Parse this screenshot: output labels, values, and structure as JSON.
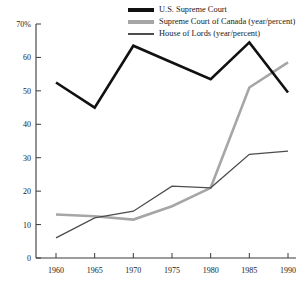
{
  "chart_data": {
    "type": "line",
    "title": "",
    "subtitle": "",
    "xlabel": "",
    "ylabel": "",
    "x": [
      1960,
      1965,
      1970,
      1975,
      1980,
      1985,
      1990
    ],
    "categories": [
      "1960",
      "1965",
      "1970",
      "1975",
      "1980",
      "1985",
      "1990"
    ],
    "xlim": [
      1960,
      1990
    ],
    "ylim": [
      0,
      70
    ],
    "y_ticks": [
      0,
      10,
      20,
      30,
      40,
      50,
      60,
      70
    ],
    "y_tick_labels": [
      "0",
      "10",
      "20",
      "30",
      "40",
      "50",
      "60",
      "70%"
    ],
    "grid": false,
    "legend_position": "top-right",
    "series": [
      {
        "name": "U.S. Supreme Court",
        "color": "#111111",
        "values": [
          52.5,
          45.0,
          63.5,
          58.5,
          53.5,
          64.5,
          49.5
        ]
      },
      {
        "name": "Supreme Court of Canada (year/percent)",
        "color": "#a6a6a6",
        "values": [
          13.0,
          12.5,
          11.5,
          15.5,
          21.0,
          51.0,
          58.5
        ]
      },
      {
        "name": "House of Lords (year/percent)",
        "color": "#4d4d4d",
        "values": [
          6.0,
          12.0,
          14.0,
          21.5,
          21.0,
          31.0,
          32.0
        ]
      }
    ]
  },
  "legend": {
    "items": [
      {
        "label": "U.S. Supreme Court"
      },
      {
        "label": "Supreme Court of Canada (year/percent)"
      },
      {
        "label": "House of Lords (year/percent)"
      }
    ]
  },
  "axes": {
    "y_labels": [
      "70%",
      "60",
      "50",
      "40",
      "30",
      "20",
      "10",
      "0"
    ],
    "x_labels": [
      "1960",
      "1965",
      "1970",
      "1975",
      "1980",
      "1985",
      "1990"
    ]
  }
}
